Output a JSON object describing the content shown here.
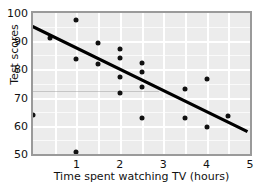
{
  "chart_data": {
    "type": "scatter",
    "title": "",
    "xlabel": "Time spent watching TV (hours)",
    "ylabel": "Test scores",
    "xlim": [
      0,
      5
    ],
    "ylim": [
      50,
      100
    ],
    "xticks": [
      1,
      2,
      3,
      4,
      5
    ],
    "yticks": [
      100,
      90,
      80,
      70,
      60,
      50
    ],
    "xtick_labels": [
      "1",
      "2",
      "3",
      "4",
      "5"
    ],
    "ytick_labels": [
      "100",
      "90",
      "80",
      "70",
      "60",
      "50"
    ],
    "grid": true,
    "grid_color": "#ffffff",
    "plot_background": "#ececec",
    "point_color": "#111111",
    "legend": null,
    "points": [
      {
        "x": 0.0,
        "y": 64.0
      },
      {
        "x": 0.4,
        "y": 91.2
      },
      {
        "x": 1.0,
        "y": 97.5
      },
      {
        "x": 1.0,
        "y": 83.7
      },
      {
        "x": 1.0,
        "y": 50.6
      },
      {
        "x": 1.5,
        "y": 89.3
      },
      {
        "x": 1.5,
        "y": 81.9
      },
      {
        "x": 2.0,
        "y": 87.4
      },
      {
        "x": 2.0,
        "y": 84.1
      },
      {
        "x": 2.0,
        "y": 77.4
      },
      {
        "x": 2.0,
        "y": 71.8
      },
      {
        "x": 2.5,
        "y": 82.4
      },
      {
        "x": 2.5,
        "y": 79.1
      },
      {
        "x": 2.5,
        "y": 73.8
      },
      {
        "x": 2.5,
        "y": 62.9
      },
      {
        "x": 3.5,
        "y": 73.1
      },
      {
        "x": 3.5,
        "y": 62.9
      },
      {
        "x": 4.0,
        "y": 76.6
      },
      {
        "x": 4.0,
        "y": 59.6
      },
      {
        "x": 4.5,
        "y": 63.4
      }
    ],
    "trend_line": {
      "type": "linear",
      "color": "#000000",
      "x_start": 0.0,
      "y_start": 95.0,
      "x_end": 5.0,
      "y_end": 57.0,
      "slope": -7.6,
      "intercept": 95.0
    }
  }
}
